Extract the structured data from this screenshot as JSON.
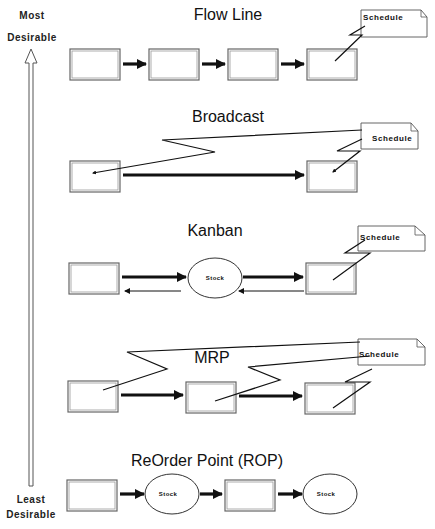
{
  "axis": {
    "top_label_line1": "Most",
    "top_label_line2": "Desirable",
    "bottom_label_line1": "Least",
    "bottom_label_line2": "Desirable",
    "direction": "up"
  },
  "sections": [
    {
      "title": "Flow Line",
      "note": "Schedule",
      "nodes": [
        "process",
        "process",
        "process",
        "process"
      ],
      "schedule_links_to": [
        4
      ]
    },
    {
      "title": "Broadcast",
      "note": "Schedule",
      "nodes": [
        "process",
        "process"
      ],
      "schedule_links_to": [
        1,
        2
      ]
    },
    {
      "title": "Kanban",
      "note": "Schedule",
      "nodes": [
        "process",
        "Stock",
        "process"
      ],
      "stock_label": "Stock",
      "schedule_links_to": [
        3
      ],
      "return_arrows": true
    },
    {
      "title": "MRP",
      "note": "Schedule",
      "nodes": [
        "process",
        "process",
        "process"
      ],
      "schedule_links_to": [
        1,
        2,
        3
      ]
    },
    {
      "title": "ReOrder Point (ROP)",
      "nodes": [
        "process",
        "Stock",
        "process",
        "Stock"
      ],
      "stock_label_1": "Stock",
      "stock_label_2": "Stock"
    }
  ],
  "colors": {
    "line": "#111111",
    "box_border": "#666666",
    "background": "#ffffff"
  }
}
